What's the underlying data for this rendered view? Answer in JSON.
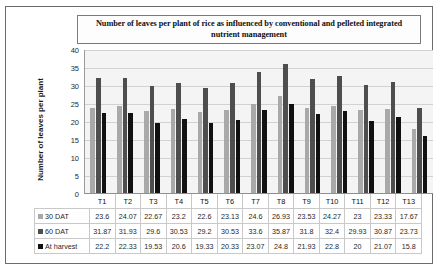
{
  "chart_data": {
    "type": "bar",
    "title": "Number of leaves per plant of rice as influenced by conventional and pelleted integrated nutrient management",
    "xlabel": "",
    "ylabel": "Number of leaves per plant",
    "ylim": [
      0,
      40
    ],
    "ytick_step": 5,
    "yticks": [
      40,
      35,
      30,
      25,
      20,
      15,
      10,
      5,
      0
    ],
    "grid": true,
    "legend_position": "data-table-row-labels",
    "categories": [
      "T1",
      "T2",
      "T3",
      "T4",
      "T5",
      "T6",
      "T7",
      "T8",
      "T9",
      "T10",
      "T11",
      "T12",
      "T13"
    ],
    "series": [
      {
        "name": "30 DAT",
        "color": "#a9a9a9",
        "marker": "light-gray-square",
        "values": [
          23.6,
          24.07,
          22.67,
          23.2,
          22.6,
          23.13,
          24.6,
          26.93,
          23.53,
          24.27,
          23,
          23.33,
          17.67
        ]
      },
      {
        "name": "60 DAT",
        "color": "#4e4e4e",
        "marker": "dark-gray-square",
        "values": [
          31.87,
          31.93,
          29.6,
          30.53,
          29.2,
          30.53,
          33.6,
          35.87,
          31.8,
          32.4,
          29.93,
          30.87,
          23.73
        ]
      },
      {
        "name": "At harvest",
        "color": "#111111",
        "marker": "black-square",
        "values": [
          22.2,
          22.33,
          19.53,
          20.6,
          19.33,
          20.33,
          23.07,
          24.8,
          21.93,
          22.8,
          20,
          21.07,
          15.8
        ]
      }
    ]
  },
  "colors": {
    "series_30dat": "#a9a9a9",
    "series_60dat": "#4e4e4e",
    "series_harvest": "#111111",
    "plot_background": "#f4f4f4",
    "gridline": "#d2d2d2",
    "frame_border": "#6b6b6b"
  }
}
